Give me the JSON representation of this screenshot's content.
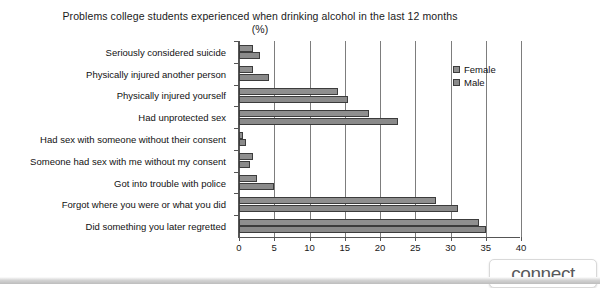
{
  "chart_data": {
    "type": "bar",
    "orientation": "horizontal",
    "title": "Problems college students experienced when drinking alcohol in the last 12 months (%)",
    "xlabel": "",
    "ylabel": "",
    "xlim": [
      0,
      40
    ],
    "xticks": [
      0,
      5,
      10,
      15,
      20,
      25,
      30,
      35,
      40
    ],
    "xtick_labels": [
      "0",
      "5",
      "10",
      "15",
      "20",
      "25",
      "30",
      "35",
      "40"
    ],
    "grid": "vertical",
    "legend_position": "top-right",
    "categories": [
      "Seriously considered suicide",
      "Physically injured another person",
      "Physically injured yourself",
      "Had unprotected sex",
      "Had sex with someone without their consent",
      "Someone had sex with me without my consent",
      "Got into trouble with police",
      "Forgot where you were or what you did",
      "Did something you later regretted"
    ],
    "series": [
      {
        "name": "Female",
        "color": "#8f8f8f",
        "values": [
          2.0,
          2.0,
          14.0,
          18.5,
          0.5,
          2.0,
          2.5,
          28.0,
          34.0
        ]
      },
      {
        "name": "Male",
        "color": "#8a8a8a",
        "values": [
          3.0,
          4.2,
          15.5,
          22.5,
          1.0,
          1.5,
          5.0,
          31.0,
          35.0
        ]
      }
    ]
  },
  "legend": {
    "items": [
      {
        "label": "Female"
      },
      {
        "label": "Male"
      }
    ]
  },
  "watermark": {
    "label": "connect"
  },
  "colors": {
    "female": "#8f8f8f",
    "male": "#8a8a8a",
    "axis": "#555555",
    "grid": "#7d7d7d",
    "text": "#111111"
  }
}
